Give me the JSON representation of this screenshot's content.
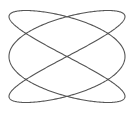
{
  "figure": {
    "type": "lissajous-curve",
    "freq_x": 3,
    "freq_y": 2,
    "phase_x": 1.5707963,
    "center": [
      67,
      56.5
    ],
    "amplitude": [
      58,
      46
    ],
    "stroke_color": "#555555",
    "stroke_width": 1.1,
    "background": "#ffffff"
  }
}
